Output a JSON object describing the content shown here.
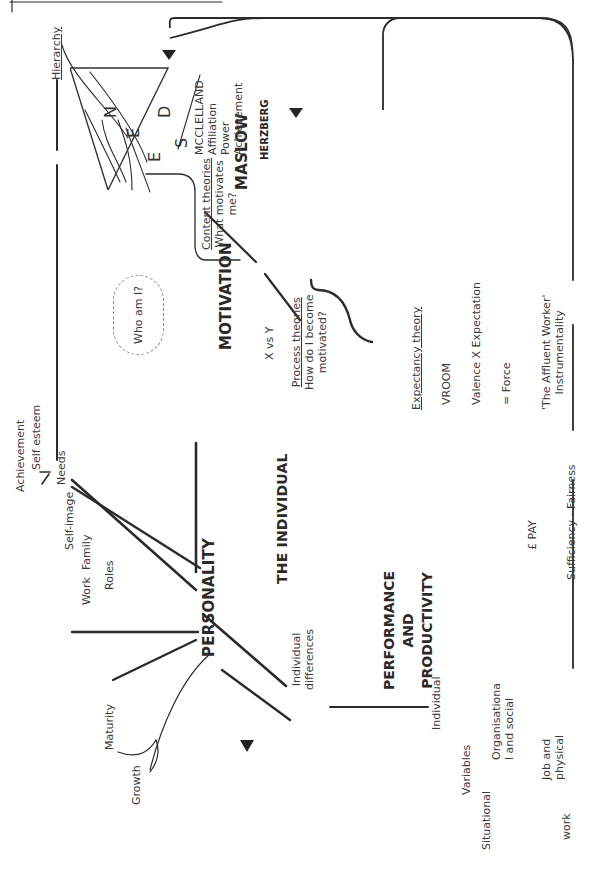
{
  "title": "THE INDIVIDUAL",
  "personality": {
    "label": "PERSONALITY",
    "branches": {
      "needs": {
        "label": "Needs",
        "items": [
          "Achievement",
          "Self esteem"
        ]
      },
      "self_image": {
        "label": "Self-image"
      },
      "roles": {
        "label": "Roles",
        "items": [
          "Work",
          "Family"
        ]
      },
      "growth": {
        "items": [
          "Maturity",
          "Growth"
        ]
      },
      "individual_differences": {
        "line1": "Individual",
        "line2": "differences"
      }
    }
  },
  "motivation": {
    "label": "MOTIVATION",
    "thought_bubbles": [
      "Who am I?",
      "Why work?",
      "How am I doing?"
    ],
    "how_am_i_doing": {
      "line1": "How am I",
      "line2": "doing?"
    },
    "x_vs_y": "X vs Y",
    "content_theories": {
      "heading": "Content theories",
      "line1": "What motivates",
      "line2": "me?",
      "needs_letters": [
        "N",
        "E",
        "E",
        "D",
        "S"
      ]
    },
    "process_theories": {
      "heading": "Process theories",
      "line1": "How do I become",
      "line2": "motivated?"
    }
  },
  "maslow": {
    "label": "MASLOW",
    "hierarchy_label": "Hierarchy",
    "pyramid": [
      "self-actualisation",
      "esteem",
      "love/social",
      "safety",
      "psychological"
    ]
  },
  "mcclelland": {
    "label": "MCCLELLAND",
    "items": [
      "Affiliation",
      "Power",
      "Achievement"
    ]
  },
  "herzberg": {
    "label": "HERZBERG",
    "motivators": {
      "heading": "Motivators",
      "items": [
        "Status",
        "Recognition",
        "Advancement",
        "Responsibility"
      ]
    },
    "hygiene": {
      "heading": "Hygiene factors",
      "items": [
        "Pay",
        "Job security",
        "Supervision",
        "Conditions"
      ]
    }
  },
  "expectancy": {
    "heading": "Expectancy theory",
    "author": "VROOM",
    "formula": "Valence X Expectation",
    "result": "= Force"
  },
  "affluent_worker": {
    "line1": "'The Affluent Worker'",
    "line2": "Instrumentality"
  },
  "pay": {
    "bag_label": "£ PAY",
    "line_label": "Sufficiency - Fairness"
  },
  "performance": {
    "line1": "PERFORMANCE",
    "line2": "AND",
    "line3": "PRODUCTIVITY"
  },
  "variables": {
    "center": "Variables",
    "individual": "Individual",
    "situational": "Situational",
    "organisational": {
      "line1": "Organisationa",
      "line2": "l and social"
    },
    "job": {
      "line1": "Job and",
      "line2": "physical"
    }
  },
  "factory": {
    "label": "work"
  }
}
